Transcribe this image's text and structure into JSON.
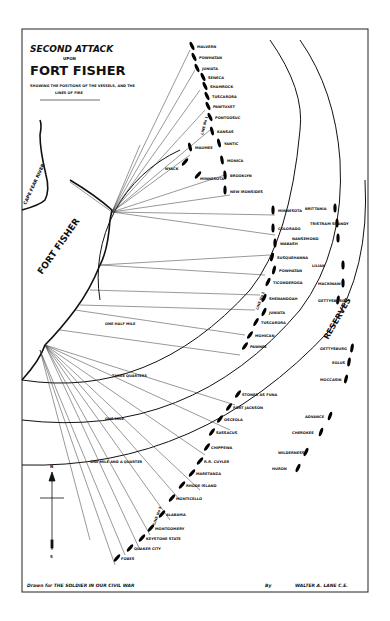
{
  "title": {
    "line1": "SECOND ATTACK",
    "line2": "UPON",
    "line3": "FORT FISHER",
    "subtitle1": "SHOWING THE POSITIONS OF THE VESSELS, AND THE",
    "subtitle2": "LINES OF FIRE"
  },
  "places": {
    "fort": "FORT FISHER",
    "river": "CAPE FEAR RIVER",
    "reserves": "RESERVES"
  },
  "ranges": {
    "one_half_mile": "ONE HALF MILE",
    "three_quarters": "THREE QUARTERS",
    "one_mile": "ONE MILE",
    "one_mile_quarter": "ONE MILE AND A QUARTER"
  },
  "lines": {
    "line1": "LINE No 1",
    "line2": "LINE No 2",
    "line3": "LINE No 3"
  },
  "compass": {
    "north": "N",
    "south": "S"
  },
  "vessels_line1": [
    "MALVERN",
    "POWHATAN",
    "JUNIATA",
    "SENECA",
    "SHAMROCK",
    "TUSCARORA",
    "PAWTUXET",
    "PONTOOSUC",
    "KANSAS",
    "YANTIC",
    "MAUMEE",
    "NYACK",
    "MINNESOTA",
    "MONICA",
    "BROOKLYN",
    "NEW IRONSIDES"
  ],
  "vessels_line2": [
    "MINNESOTA",
    "COLORADO",
    "WABASH",
    "SUSQUEHANNA",
    "POWHATAN",
    "TICONDEROGA",
    "SHENANDOAH",
    "JUNIATA",
    "TUSCARORA",
    "MOHICAN",
    "PAWNEE"
  ],
  "vessels_reserves": [
    "BRITTANIA",
    "TRISTRAM SHANDY",
    "NANSEMOND",
    "LILIAN",
    "MACKINAW",
    "GETTYSBURG",
    "EOLUS",
    "MOCCASIN",
    "ADVANCE",
    "CHEROKEE",
    "WILDERNESS",
    "HURON",
    "R.R. CUYLER"
  ],
  "vessels_line3": [
    "STONER AS FUNA",
    "FORT JACKSON",
    "OSCEOLA",
    "SASSACUS",
    "CHIPPEWA",
    "R.R. CUYLER",
    "MARETANZA",
    "RHODE ISLAND",
    "MONTICELLO",
    "ALABAMA",
    "MONTGOMERY",
    "KEYSTONE STATE",
    "QUAKER CITY",
    "FOBES"
  ],
  "footer": {
    "left": "Drawn for THE SOLDIER IN OUR CIVIL WAR",
    "by": "By",
    "author": "WALTER A. LANE C.E."
  },
  "colors": {
    "ink": "#111111",
    "paper": "#ffffff"
  }
}
